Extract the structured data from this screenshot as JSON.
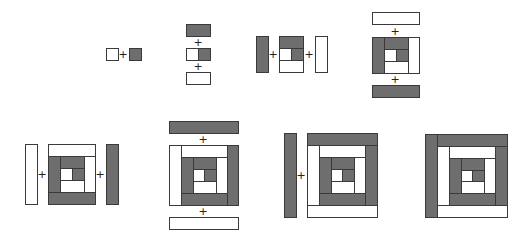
{
  "colors": {
    "dark": "#6e6e6e",
    "light": "#ffffff",
    "stroke": "#3a3a3a",
    "plus": "#222222"
  },
  "plus_symbol": "+",
  "steps": [
    {
      "id": "step-1",
      "pieces": [
        {
          "x": 106,
          "y": 48,
          "w": 12,
          "h": 12,
          "tone": "light"
        },
        {
          "x": 129,
          "y": 48,
          "w": 12,
          "h": 12,
          "tone": "dark"
        }
      ],
      "pluses": [
        {
          "x": 123,
          "y": 54
        }
      ]
    },
    {
      "id": "step-2",
      "pieces": [
        {
          "x": 186,
          "y": 24,
          "w": 24,
          "h": 12,
          "tone": "dark"
        },
        {
          "x": 186,
          "y": 48,
          "w": 12,
          "h": 12,
          "tone": "light"
        },
        {
          "x": 198,
          "y": 48,
          "w": 12,
          "h": 12,
          "tone": "dark"
        },
        {
          "x": 186,
          "y": 72,
          "w": 24,
          "h": 12,
          "tone": "light"
        }
      ],
      "pluses": [
        {
          "x": 198,
          "y": 42
        },
        {
          "x": 198,
          "y": 66
        }
      ]
    },
    {
      "id": "step-3",
      "pieces": [
        {
          "x": 256,
          "y": 36,
          "w": 12,
          "h": 36,
          "tone": "dark"
        },
        {
          "x": 279,
          "y": 36,
          "w": 24,
          "h": 12,
          "tone": "dark"
        },
        {
          "x": 279,
          "y": 48,
          "w": 12,
          "h": 12,
          "tone": "light"
        },
        {
          "x": 291,
          "y": 48,
          "w": 12,
          "h": 12,
          "tone": "dark"
        },
        {
          "x": 279,
          "y": 60,
          "w": 24,
          "h": 12,
          "tone": "light"
        },
        {
          "x": 315,
          "y": 36,
          "w": 12,
          "h": 36,
          "tone": "light"
        }
      ],
      "pluses": [
        {
          "x": 273,
          "y": 54
        },
        {
          "x": 309,
          "y": 54
        }
      ]
    },
    {
      "id": "step-4",
      "pieces": [
        {
          "x": 372,
          "y": 12,
          "w": 47,
          "h": 12,
          "tone": "light"
        },
        {
          "x": 372,
          "y": 37,
          "w": 12,
          "h": 36,
          "tone": "dark"
        },
        {
          "x": 384,
          "y": 37,
          "w": 24,
          "h": 12,
          "tone": "dark"
        },
        {
          "x": 384,
          "y": 49,
          "w": 12,
          "h": 12,
          "tone": "light"
        },
        {
          "x": 396,
          "y": 49,
          "w": 12,
          "h": 12,
          "tone": "dark"
        },
        {
          "x": 384,
          "y": 61,
          "w": 24,
          "h": 12,
          "tone": "light"
        },
        {
          "x": 408,
          "y": 37,
          "w": 11,
          "h": 36,
          "tone": "light"
        },
        {
          "x": 372,
          "y": 85,
          "w": 47,
          "h": 12,
          "tone": "dark"
        }
      ],
      "pluses": [
        {
          "x": 395,
          "y": 31
        },
        {
          "x": 395,
          "y": 79
        }
      ]
    },
    {
      "id": "step-5",
      "pieces": [
        {
          "x": 25,
          "y": 144,
          "w": 12,
          "h": 60,
          "tone": "light"
        },
        {
          "x": 48,
          "y": 144,
          "w": 47,
          "h": 12,
          "tone": "light"
        },
        {
          "x": 48,
          "y": 156,
          "w": 12,
          "h": 36,
          "tone": "dark"
        },
        {
          "x": 60,
          "y": 156,
          "w": 24,
          "h": 12,
          "tone": "dark"
        },
        {
          "x": 60,
          "y": 168,
          "w": 12,
          "h": 12,
          "tone": "light"
        },
        {
          "x": 72,
          "y": 168,
          "w": 12,
          "h": 12,
          "tone": "dark"
        },
        {
          "x": 60,
          "y": 180,
          "w": 24,
          "h": 12,
          "tone": "light"
        },
        {
          "x": 84,
          "y": 156,
          "w": 11,
          "h": 36,
          "tone": "light"
        },
        {
          "x": 48,
          "y": 192,
          "w": 47,
          "h": 12,
          "tone": "dark"
        },
        {
          "x": 106,
          "y": 144,
          "w": 12,
          "h": 60,
          "tone": "dark"
        }
      ],
      "pluses": [
        {
          "x": 42,
          "y": 174
        },
        {
          "x": 100,
          "y": 174
        }
      ]
    },
    {
      "id": "step-6",
      "pieces": [
        {
          "x": 169,
          "y": 121,
          "w": 69,
          "h": 12,
          "tone": "dark"
        },
        {
          "x": 169,
          "y": 145,
          "w": 12,
          "h": 60,
          "tone": "light"
        },
        {
          "x": 181,
          "y": 145,
          "w": 46,
          "h": 12,
          "tone": "light"
        },
        {
          "x": 181,
          "y": 157,
          "w": 12,
          "h": 36,
          "tone": "dark"
        },
        {
          "x": 193,
          "y": 157,
          "w": 23,
          "h": 12,
          "tone": "dark"
        },
        {
          "x": 193,
          "y": 169,
          "w": 11,
          "h": 12,
          "tone": "light"
        },
        {
          "x": 204,
          "y": 169,
          "w": 12,
          "h": 12,
          "tone": "dark"
        },
        {
          "x": 193,
          "y": 181,
          "w": 23,
          "h": 12,
          "tone": "light"
        },
        {
          "x": 216,
          "y": 157,
          "w": 11,
          "h": 36,
          "tone": "light"
        },
        {
          "x": 181,
          "y": 193,
          "w": 46,
          "h": 12,
          "tone": "dark"
        },
        {
          "x": 227,
          "y": 145,
          "w": 11,
          "h": 60,
          "tone": "dark"
        },
        {
          "x": 169,
          "y": 217,
          "w": 69,
          "h": 12,
          "tone": "light"
        }
      ],
      "pluses": [
        {
          "x": 203,
          "y": 139
        },
        {
          "x": 203,
          "y": 211
        }
      ]
    },
    {
      "id": "step-7",
      "pieces": [
        {
          "x": 284,
          "y": 133,
          "w": 12,
          "h": 84,
          "tone": "dark"
        },
        {
          "x": 307,
          "y": 133,
          "w": 70,
          "h": 12,
          "tone": "dark"
        },
        {
          "x": 307,
          "y": 145,
          "w": 12,
          "h": 60,
          "tone": "light"
        },
        {
          "x": 319,
          "y": 145,
          "w": 46,
          "h": 12,
          "tone": "light"
        },
        {
          "x": 319,
          "y": 157,
          "w": 12,
          "h": 36,
          "tone": "dark"
        },
        {
          "x": 331,
          "y": 157,
          "w": 23,
          "h": 12,
          "tone": "dark"
        },
        {
          "x": 331,
          "y": 169,
          "w": 11,
          "h": 12,
          "tone": "light"
        },
        {
          "x": 342,
          "y": 169,
          "w": 12,
          "h": 12,
          "tone": "dark"
        },
        {
          "x": 331,
          "y": 181,
          "w": 23,
          "h": 12,
          "tone": "light"
        },
        {
          "x": 354,
          "y": 157,
          "w": 11,
          "h": 36,
          "tone": "light"
        },
        {
          "x": 319,
          "y": 193,
          "w": 46,
          "h": 12,
          "tone": "dark"
        },
        {
          "x": 365,
          "y": 145,
          "w": 12,
          "h": 60,
          "tone": "dark"
        },
        {
          "x": 307,
          "y": 205,
          "w": 70,
          "h": 12,
          "tone": "light"
        }
      ],
      "pluses": [
        {
          "x": 301,
          "y": 175
        }
      ]
    },
    {
      "id": "step-8",
      "pieces": [
        {
          "x": 425,
          "y": 134,
          "w": 12,
          "h": 83,
          "tone": "dark"
        },
        {
          "x": 437,
          "y": 134,
          "w": 70,
          "h": 12,
          "tone": "dark"
        },
        {
          "x": 437,
          "y": 146,
          "w": 12,
          "h": 59,
          "tone": "light"
        },
        {
          "x": 449,
          "y": 146,
          "w": 46,
          "h": 12,
          "tone": "light"
        },
        {
          "x": 449,
          "y": 158,
          "w": 12,
          "h": 35,
          "tone": "dark"
        },
        {
          "x": 461,
          "y": 158,
          "w": 23,
          "h": 12,
          "tone": "dark"
        },
        {
          "x": 461,
          "y": 170,
          "w": 11,
          "h": 11,
          "tone": "light"
        },
        {
          "x": 472,
          "y": 170,
          "w": 12,
          "h": 11,
          "tone": "dark"
        },
        {
          "x": 461,
          "y": 181,
          "w": 23,
          "h": 12,
          "tone": "light"
        },
        {
          "x": 484,
          "y": 158,
          "w": 11,
          "h": 35,
          "tone": "light"
        },
        {
          "x": 449,
          "y": 193,
          "w": 46,
          "h": 12,
          "tone": "dark"
        },
        {
          "x": 495,
          "y": 146,
          "w": 12,
          "h": 59,
          "tone": "dark"
        },
        {
          "x": 437,
          "y": 205,
          "w": 70,
          "h": 12,
          "tone": "light"
        }
      ],
      "pluses": []
    }
  ]
}
